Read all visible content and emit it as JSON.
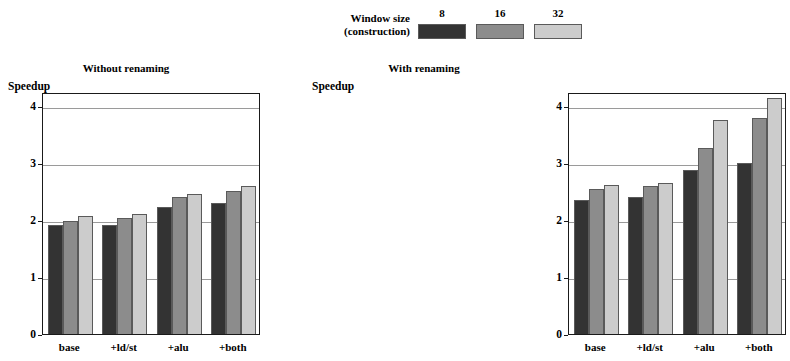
{
  "legend": {
    "label_line1": "Window size",
    "label_line2": "(construction)",
    "entries": [
      {
        "name": "8",
        "color": "#333333"
      },
      {
        "name": "16",
        "color": "#8c8c8c"
      },
      {
        "name": "32",
        "color": "#cccccc"
      }
    ]
  },
  "chart_data": [
    {
      "type": "bar",
      "title": "Without renaming",
      "xlabel": "",
      "ylabel": "Speedup",
      "categories": [
        "base",
        "+ld/st",
        "+alu",
        "+both"
      ],
      "series": [
        {
          "name": "8",
          "color": "#333333",
          "values": [
            1.91,
            1.91,
            2.23,
            2.3
          ]
        },
        {
          "name": "16",
          "color": "#8c8c8c",
          "values": [
            1.98,
            2.03,
            2.4,
            2.52
          ]
        },
        {
          "name": "32",
          "color": "#cccccc",
          "values": [
            2.07,
            2.11,
            2.46,
            2.6
          ]
        }
      ],
      "yticks": [
        0,
        1,
        2,
        3,
        4
      ],
      "ylim": [
        0,
        4.25
      ],
      "grid": true,
      "legend_position": "top-center"
    },
    {
      "type": "bar",
      "title": "With renaming",
      "xlabel": "",
      "ylabel": "Speedup",
      "categories": [
        "base",
        "+ld/st",
        "+alu",
        "+both"
      ],
      "series": [
        {
          "name": "8",
          "color": "#333333",
          "values": [
            2.35,
            2.4,
            2.88,
            3.01
          ]
        },
        {
          "name": "16",
          "color": "#8c8c8c",
          "values": [
            2.55,
            2.6,
            3.27,
            3.79
          ]
        },
        {
          "name": "32",
          "color": "#cccccc",
          "values": [
            2.62,
            2.65,
            3.76,
            4.15
          ]
        }
      ],
      "yticks": [
        0,
        1,
        2,
        3,
        4
      ],
      "ylim": [
        0,
        4.25
      ],
      "grid": true,
      "legend_position": "top-center"
    }
  ]
}
